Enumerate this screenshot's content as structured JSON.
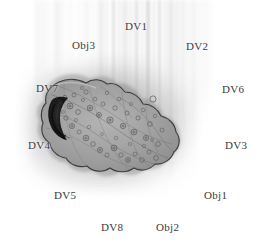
{
  "figure": {
    "type": "grayscale-micrograph",
    "background_color": "#ffffff",
    "label_color": "#3a3a3a",
    "cell_fill_color": "#9b9b9b",
    "cell_outline_color": "#3d3d3d",
    "nucleus_color": "#1f1f1f",
    "streak_color": "#8a8a8a"
  },
  "labels": [
    {
      "id": "dv1",
      "text": "DV1",
      "x": 125,
      "y": 20
    },
    {
      "id": "obj3",
      "text": "Obj3",
      "x": 72,
      "y": 39
    },
    {
      "id": "dv2",
      "text": "DV2",
      "x": 186,
      "y": 40
    },
    {
      "id": "dv7",
      "text": "DV7",
      "x": 36,
      "y": 82
    },
    {
      "id": "dv6",
      "text": "DV6",
      "x": 222,
      "y": 83
    },
    {
      "id": "dv4",
      "text": "DV4",
      "x": 28,
      "y": 139
    },
    {
      "id": "dv3",
      "text": "DV3",
      "x": 225,
      "y": 139
    },
    {
      "id": "dv5",
      "text": "DV5",
      "x": 54,
      "y": 189
    },
    {
      "id": "obj1",
      "text": "Obj1",
      "x": 204,
      "y": 189
    },
    {
      "id": "dv8",
      "text": "DV8",
      "x": 101,
      "y": 221
    },
    {
      "id": "obj2",
      "text": "Obj2",
      "x": 156,
      "y": 221
    }
  ],
  "streaks": [
    {
      "x": 36,
      "w": 2,
      "h": 118,
      "o": 0.16,
      "b": 2.2
    },
    {
      "x": 41,
      "w": 3,
      "h": 104,
      "o": 0.12,
      "b": 2.6
    },
    {
      "x": 47,
      "w": 2,
      "h": 96,
      "o": 0.1,
      "b": 2.0
    },
    {
      "x": 55,
      "w": 4,
      "h": 88,
      "o": 0.18,
      "b": 2.4
    },
    {
      "x": 62,
      "w": 2,
      "h": 80,
      "o": 0.13,
      "b": 2.0
    },
    {
      "x": 69,
      "w": 3,
      "h": 78,
      "o": 0.09,
      "b": 2.6
    },
    {
      "x": 78,
      "w": 2,
      "h": 72,
      "o": 0.11,
      "b": 2.0
    },
    {
      "x": 85,
      "w": 3,
      "h": 70,
      "o": 0.14,
      "b": 2.3
    },
    {
      "x": 92,
      "w": 2,
      "h": 96,
      "o": 0.12,
      "b": 2.0
    },
    {
      "x": 99,
      "w": 4,
      "h": 110,
      "o": 0.22,
      "b": 2.0
    },
    {
      "x": 106,
      "w": 2,
      "h": 120,
      "o": 0.15,
      "b": 1.8
    },
    {
      "x": 112,
      "w": 3,
      "h": 150,
      "o": 0.26,
      "b": 1.8
    },
    {
      "x": 118,
      "w": 2,
      "h": 138,
      "o": 0.18,
      "b": 1.8
    },
    {
      "x": 123,
      "w": 4,
      "h": 160,
      "o": 0.24,
      "b": 2.0
    },
    {
      "x": 130,
      "w": 2,
      "h": 155,
      "o": 0.16,
      "b": 1.6
    },
    {
      "x": 135,
      "w": 3,
      "h": 168,
      "o": 0.28,
      "b": 1.8
    },
    {
      "x": 141,
      "w": 2,
      "h": 150,
      "o": 0.17,
      "b": 1.6
    },
    {
      "x": 146,
      "w": 4,
      "h": 172,
      "o": 0.3,
      "b": 1.8
    },
    {
      "x": 153,
      "w": 2,
      "h": 165,
      "o": 0.2,
      "b": 1.6
    },
    {
      "x": 158,
      "w": 3,
      "h": 178,
      "o": 0.26,
      "b": 1.8
    },
    {
      "x": 164,
      "w": 2,
      "h": 170,
      "o": 0.18,
      "b": 1.6
    },
    {
      "x": 169,
      "w": 4,
      "h": 182,
      "o": 0.28,
      "b": 2.0
    },
    {
      "x": 176,
      "w": 2,
      "h": 175,
      "o": 0.19,
      "b": 1.8
    },
    {
      "x": 181,
      "w": 3,
      "h": 168,
      "o": 0.22,
      "b": 2.0
    },
    {
      "x": 187,
      "w": 2,
      "h": 160,
      "o": 0.15,
      "b": 2.0
    },
    {
      "x": 192,
      "w": 3,
      "h": 150,
      "o": 0.18,
      "b": 2.2
    },
    {
      "x": 198,
      "w": 2,
      "h": 140,
      "o": 0.12,
      "b": 2.2
    },
    {
      "x": 203,
      "w": 3,
      "h": 128,
      "o": 0.1,
      "b": 2.4
    },
    {
      "x": 209,
      "w": 2,
      "h": 112,
      "o": 0.08,
      "b": 2.4
    }
  ],
  "granules": [
    {
      "x": 60,
      "y": 103,
      "r": 2.6,
      "o": 0.55
    },
    {
      "x": 65,
      "y": 97,
      "r": 1.8,
      "o": 0.45
    },
    {
      "x": 70,
      "y": 106,
      "r": 3.0,
      "o": 0.5
    },
    {
      "x": 74,
      "y": 95,
      "r": 2.0,
      "o": 0.42
    },
    {
      "x": 78,
      "y": 112,
      "r": 2.4,
      "o": 0.48
    },
    {
      "x": 83,
      "y": 100,
      "r": 1.6,
      "o": 0.4
    },
    {
      "x": 86,
      "y": 92,
      "r": 2.2,
      "o": 0.44
    },
    {
      "x": 90,
      "y": 108,
      "r": 2.8,
      "o": 0.52
    },
    {
      "x": 95,
      "y": 99,
      "r": 1.9,
      "o": 0.4
    },
    {
      "x": 99,
      "y": 115,
      "r": 2.5,
      "o": 0.5
    },
    {
      "x": 103,
      "y": 104,
      "r": 2.0,
      "o": 0.43
    },
    {
      "x": 107,
      "y": 93,
      "r": 1.7,
      "o": 0.38
    },
    {
      "x": 110,
      "y": 120,
      "r": 3.1,
      "o": 0.55
    },
    {
      "x": 115,
      "y": 108,
      "r": 2.2,
      "o": 0.46
    },
    {
      "x": 119,
      "y": 99,
      "r": 1.8,
      "o": 0.4
    },
    {
      "x": 123,
      "y": 126,
      "r": 2.7,
      "o": 0.5
    },
    {
      "x": 127,
      "y": 113,
      "r": 2.0,
      "o": 0.44
    },
    {
      "x": 131,
      "y": 104,
      "r": 1.6,
      "o": 0.36
    },
    {
      "x": 134,
      "y": 132,
      "r": 2.9,
      "o": 0.52
    },
    {
      "x": 138,
      "y": 118,
      "r": 2.1,
      "o": 0.45
    },
    {
      "x": 143,
      "y": 110,
      "r": 1.8,
      "o": 0.38
    },
    {
      "x": 146,
      "y": 138,
      "r": 2.6,
      "o": 0.48
    },
    {
      "x": 150,
      "y": 124,
      "r": 2.3,
      "o": 0.46
    },
    {
      "x": 155,
      "y": 116,
      "r": 1.7,
      "o": 0.36
    },
    {
      "x": 158,
      "y": 144,
      "r": 2.4,
      "o": 0.44
    },
    {
      "x": 162,
      "y": 130,
      "r": 2.0,
      "o": 0.4
    },
    {
      "x": 66,
      "y": 118,
      "r": 2.2,
      "o": 0.46
    },
    {
      "x": 72,
      "y": 126,
      "r": 2.6,
      "o": 0.48
    },
    {
      "x": 79,
      "y": 132,
      "r": 2.0,
      "o": 0.42
    },
    {
      "x": 86,
      "y": 138,
      "r": 2.8,
      "o": 0.5
    },
    {
      "x": 93,
      "y": 144,
      "r": 2.3,
      "o": 0.45
    },
    {
      "x": 100,
      "y": 150,
      "r": 2.6,
      "o": 0.48
    },
    {
      "x": 107,
      "y": 155,
      "r": 2.1,
      "o": 0.42
    },
    {
      "x": 114,
      "y": 148,
      "r": 2.9,
      "o": 0.52
    },
    {
      "x": 121,
      "y": 155,
      "r": 2.2,
      "o": 0.44
    },
    {
      "x": 128,
      "y": 160,
      "r": 2.5,
      "o": 0.46
    },
    {
      "x": 135,
      "y": 154,
      "r": 1.9,
      "o": 0.38
    },
    {
      "x": 142,
      "y": 160,
      "r": 2.3,
      "o": 0.44
    },
    {
      "x": 149,
      "y": 152,
      "r": 2.0,
      "o": 0.4
    },
    {
      "x": 156,
      "y": 158,
      "r": 2.4,
      "o": 0.42
    },
    {
      "x": 63,
      "y": 112,
      "r": 1.5,
      "o": 0.35
    },
    {
      "x": 76,
      "y": 120,
      "r": 1.6,
      "o": 0.34
    },
    {
      "x": 89,
      "y": 127,
      "r": 1.7,
      "o": 0.36
    },
    {
      "x": 102,
      "y": 134,
      "r": 1.5,
      "o": 0.32
    },
    {
      "x": 116,
      "y": 138,
      "r": 1.8,
      "o": 0.38
    },
    {
      "x": 130,
      "y": 144,
      "r": 1.6,
      "o": 0.34
    },
    {
      "x": 144,
      "y": 146,
      "r": 1.7,
      "o": 0.35
    },
    {
      "x": 152,
      "y": 140,
      "r": 1.5,
      "o": 0.32
    },
    {
      "x": 161,
      "y": 106,
      "r": 2.0,
      "o": 0.34
    },
    {
      "x": 82,
      "y": 88,
      "r": 1.6,
      "o": 0.34
    }
  ]
}
